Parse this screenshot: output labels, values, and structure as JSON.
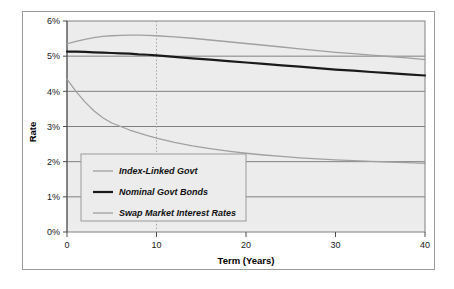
{
  "figure": {
    "background_color": "#ffffff",
    "border_color": "#9a9a9a",
    "plot_background_color": "#ececec"
  },
  "chart_data": {
    "type": "line",
    "title": "",
    "xlabel": "Term (Years)",
    "ylabel": "Rate",
    "xlim": [
      0,
      40
    ],
    "ylim": [
      0,
      6
    ],
    "xticks": [
      0,
      10,
      20,
      30,
      40
    ],
    "xtick_labels": [
      "0",
      "10",
      "20",
      "30",
      "40"
    ],
    "yticks": [
      0,
      1,
      2,
      3,
      4,
      5,
      6
    ],
    "ytick_labels": [
      "0%",
      "1%",
      "2%",
      "3%",
      "4%",
      "5%",
      "6%"
    ],
    "grid": "horizontal",
    "grid_color": "#808080",
    "legend_position": "lower-left-inside",
    "annotations": [
      {
        "name": "term-10-marker",
        "type": "vertical-dotted-line",
        "x": 10,
        "color": "#b0a9a0",
        "style": "dotted"
      }
    ],
    "x": [
      0,
      1,
      2,
      3,
      4,
      5,
      6,
      7,
      8,
      9,
      10,
      12,
      14,
      16,
      18,
      20,
      22,
      24,
      26,
      28,
      30,
      32,
      34,
      36,
      38,
      40
    ],
    "series": [
      {
        "name": "Index-Linked Govt",
        "color": "#a0a0a0",
        "width": 1.3,
        "values": [
          5.35,
          5.42,
          5.48,
          5.53,
          5.56,
          5.58,
          5.59,
          5.6,
          5.6,
          5.59,
          5.58,
          5.55,
          5.51,
          5.46,
          5.41,
          5.36,
          5.31,
          5.26,
          5.21,
          5.16,
          5.11,
          5.07,
          5.03,
          4.99,
          4.95,
          4.9
        ]
      },
      {
        "name": "Nominal Govt Bonds",
        "color": "#1a1a1a",
        "width": 2.2,
        "values": [
          5.13,
          5.13,
          5.12,
          5.11,
          5.1,
          5.09,
          5.08,
          5.07,
          5.05,
          5.04,
          5.02,
          4.98,
          4.94,
          4.9,
          4.86,
          4.82,
          4.78,
          4.74,
          4.7,
          4.66,
          4.62,
          4.59,
          4.55,
          4.52,
          4.48,
          4.45
        ]
      },
      {
        "name": "Swap Market Interest Rates",
        "color": "#a0a0a0",
        "width": 1.3,
        "values": [
          4.35,
          4.0,
          3.7,
          3.45,
          3.25,
          3.1,
          3.0,
          2.9,
          2.82,
          2.74,
          2.67,
          2.55,
          2.45,
          2.37,
          2.3,
          2.24,
          2.19,
          2.15,
          2.11,
          2.08,
          2.05,
          2.03,
          2.01,
          1.99,
          1.97,
          1.95
        ]
      }
    ]
  },
  "legend": {
    "items": [
      {
        "label": "Index-Linked Govt",
        "color": "#a0a0a0",
        "width": 1.3
      },
      {
        "label": "Nominal Govt Bonds",
        "color": "#1a1a1a",
        "width": 2.2
      },
      {
        "label": "Swap Market Interest Rates",
        "color": "#a0a0a0",
        "width": 1.3
      }
    ]
  }
}
